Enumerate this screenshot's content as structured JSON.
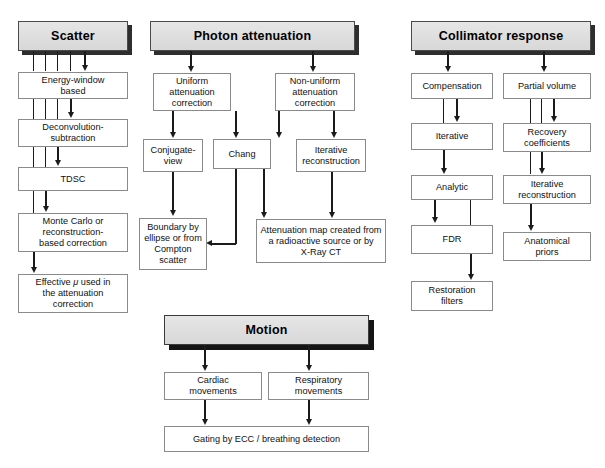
{
  "diagram": {
    "background_color": "#ffffff",
    "header_fill": "#dcdcdc",
    "header_shadow": "#2e2e2e",
    "box_border": "#8a8a8a",
    "line_color": "#1b1b1b"
  },
  "columns": [
    {
      "id": "scatter",
      "header": "Scatter",
      "nodes": [
        {
          "id": "energy-window-based",
          "label": "Energy-window\nbased"
        },
        {
          "id": "deconvolution-subtraction",
          "label": "Deconvolution-\nsubtraction"
        },
        {
          "id": "tdsc",
          "label": "TDSC"
        },
        {
          "id": "monte-carlo-or-reconstruction-based-correction",
          "label": "Monte Carlo or\nreconstruction-\nbased correction"
        },
        {
          "id": "effective-mu-used-in-the-attenuation-correction",
          "label_pre": "Effective ",
          "label_italic": "μ",
          "label_post": " used in\nthe attenuation\ncorrection"
        }
      ]
    },
    {
      "id": "photon-attenuation",
      "header": "Photon attenuation",
      "nodes": [
        {
          "id": "uniform-attenuation-correction",
          "label": "Uniform\nattenuation\ncorrection"
        },
        {
          "id": "non-uniform-attenuation-correction",
          "label": "Non-uniform\nattenuation\ncorrection"
        },
        {
          "id": "conjugate-view",
          "label": "Conjugate-\nview"
        },
        {
          "id": "chang",
          "label": "Chang"
        },
        {
          "id": "iterative-reconstruction",
          "label": "Iterative\nreconstruction"
        },
        {
          "id": "boundary-by-ellipse-or-from-compton-scatter",
          "label": "Boundary by\nellipse or from\nCompton\nscatter"
        },
        {
          "id": "attenuation-map-created-from-a-radioactive-source-or-by-x-ray-ct",
          "label": "Attenuation map created from\na radioactive source or by\nX-Ray CT"
        }
      ]
    },
    {
      "id": "collimator-response",
      "header": "Collimator response",
      "nodes": [
        {
          "id": "compensation",
          "label": "Compensation"
        },
        {
          "id": "partial-volume",
          "label": "Partial volume"
        },
        {
          "id": "iterative",
          "label": "Iterative"
        },
        {
          "id": "recovery-coefficients",
          "label": "Recovery\ncoefficients"
        },
        {
          "id": "analytic",
          "label": "Analytic"
        },
        {
          "id": "iterative-reconstruction-2",
          "label": "Iterative\nreconstruction"
        },
        {
          "id": "fdr",
          "label": "FDR"
        },
        {
          "id": "anatomical-priors",
          "label": "Anatomical\npriors"
        },
        {
          "id": "restoration-filters",
          "label": "Restoration\nfilters"
        }
      ]
    },
    {
      "id": "motion",
      "header": "Motion",
      "nodes": [
        {
          "id": "cardiac-movements",
          "label": "Cardiac\nmovements"
        },
        {
          "id": "respiratory-movements",
          "label": "Respiratory\nmovements"
        },
        {
          "id": "gating-by-ecc-breathing-detection",
          "label": "Gating by ECC / breathing detection"
        }
      ]
    }
  ]
}
